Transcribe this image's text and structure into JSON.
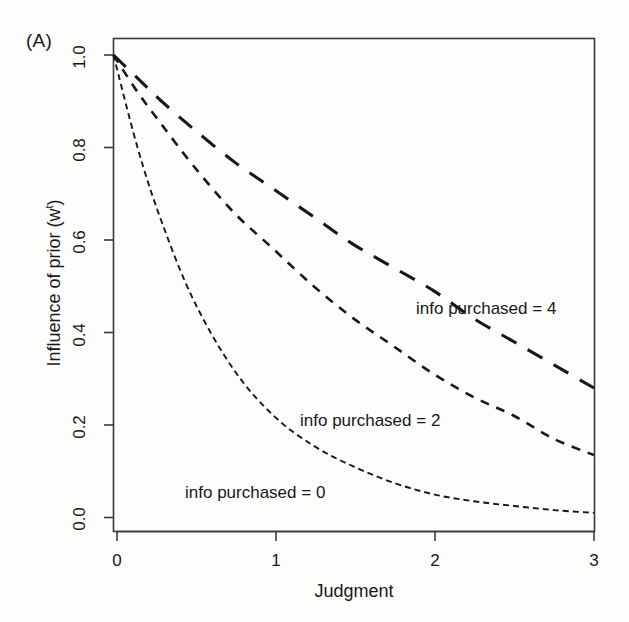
{
  "panel": {
    "label": "(A)"
  },
  "axes": {
    "xlabel": "Judgment",
    "ylabel_prefix": "Influence of prior (w",
    "ylabel_sup": "t",
    "ylabel_suffix": ")",
    "ylabel_full": "Influence of prior (w^t)",
    "xticks": [
      "0",
      "1",
      "2",
      "3"
    ],
    "yticks": [
      "0.0",
      "0.2",
      "0.4",
      "0.6",
      "0.8",
      "1.0"
    ]
  },
  "annotations": {
    "info4": "info purchased = 4",
    "info2": "info purchased = 2",
    "info0": "info purchased = 0"
  },
  "colors": {
    "ink": "#181818",
    "background": "#fdfdfc",
    "frame": "#3a3a3a"
  },
  "chart_data": {
    "type": "line",
    "title": "",
    "xlabel": "Judgment",
    "ylabel": "Influence of prior (w^t)",
    "xlim": [
      0,
      3
    ],
    "ylim": [
      0.0,
      1.0
    ],
    "xticks": [
      0,
      1,
      2,
      3
    ],
    "yticks": [
      0.0,
      0.2,
      0.4,
      0.6,
      0.8,
      1.0
    ],
    "grid": false,
    "legend": "inline-annotations",
    "x": [
      0,
      0.15,
      0.3,
      0.5,
      0.75,
      1.0,
      1.25,
      1.5,
      1.75,
      2.0,
      2.25,
      2.5,
      2.75,
      3.0
    ],
    "series": [
      {
        "name": "info purchased = 4",
        "label": "info purchased = 4",
        "linestyle": "long-dash",
        "values": [
          1.0,
          0.95,
          0.9,
          0.84,
          0.77,
          0.71,
          0.65,
          0.59,
          0.54,
          0.49,
          0.43,
          0.38,
          0.33,
          0.28
        ]
      },
      {
        "name": "info purchased = 2",
        "label": "info purchased = 2",
        "linestyle": "short-dash",
        "values": [
          1.0,
          0.92,
          0.85,
          0.76,
          0.66,
          0.58,
          0.5,
          0.43,
          0.37,
          0.31,
          0.26,
          0.22,
          0.17,
          0.135
        ]
      },
      {
        "name": "info purchased = 0",
        "label": "info purchased = 0",
        "linestyle": "dot-dash",
        "values": [
          1.0,
          0.8,
          0.64,
          0.47,
          0.32,
          0.22,
          0.155,
          0.11,
          0.075,
          0.05,
          0.035,
          0.025,
          0.016,
          0.01
        ]
      }
    ]
  }
}
